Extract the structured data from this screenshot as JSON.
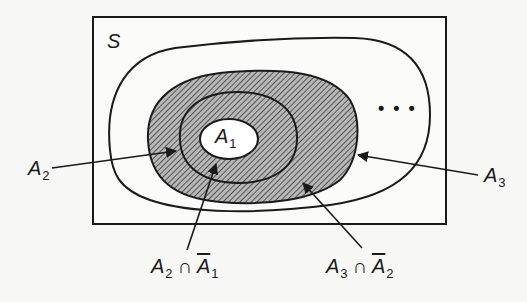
{
  "diagram": {
    "type": "venn-nested-sets",
    "universe_label": "S",
    "sets": [
      {
        "name": "A1",
        "base": "A",
        "sub": "1"
      },
      {
        "name": "A2",
        "base": "A",
        "sub": "2"
      },
      {
        "name": "A3",
        "base": "A",
        "sub": "3"
      }
    ],
    "labels": {
      "s": "S",
      "a1": {
        "base": "A",
        "sub": "1"
      },
      "a2": {
        "base": "A",
        "sub": "2"
      },
      "a3": {
        "base": "A",
        "sub": "3"
      },
      "a2_cap_not_a1": {
        "left_base": "A",
        "left_sub": "2",
        "op": "∩",
        "right_base": "A",
        "right_sub": "1",
        "right_complement": true
      },
      "a3_cap_not_a2": {
        "left_base": "A",
        "left_sub": "3",
        "op": "∩",
        "right_base": "A",
        "right_sub": "2",
        "right_complement": true
      }
    },
    "continuation": "• • •",
    "colors": {
      "line": "#1a1a1a",
      "hatch_fill": "#8a8a8a",
      "background": "#f7f7f5",
      "inner_white": "#ffffff"
    }
  }
}
